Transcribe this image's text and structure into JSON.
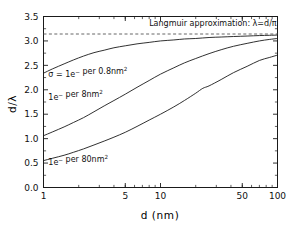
{
  "chart_data": {
    "type": "line",
    "title": "",
    "xlabel": "d  (nm)",
    "ylabel": "d/λ",
    "xscale": "log",
    "yscale": "linear",
    "xlim": [
      1,
      100
    ],
    "ylim": [
      0.0,
      3.5
    ],
    "grid": false,
    "legend_position": "inline-annotations",
    "xticks": [
      1,
      5,
      10,
      50,
      100
    ],
    "xticklabels": [
      "1",
      "5",
      "10",
      "50",
      "100"
    ],
    "yticks": [
      0.0,
      0.5,
      1.0,
      1.5,
      2.0,
      2.5,
      3.0,
      3.5
    ],
    "yticklabels": [
      "0.0",
      "0.5",
      "1.0",
      "1.5",
      "2.0",
      "2.5",
      "3.0",
      "3.5"
    ],
    "annotations": [
      {
        "name": "langmuir-approximation-label",
        "text": "Langmuir approximation: λ=d/π",
        "x": 8.0,
        "y": 3.3
      },
      {
        "name": "sigma-0p8nm2-label",
        "text": "σ = 1e⁻ per 0.8nm²",
        "x": 1.1,
        "y": 2.26
      },
      {
        "name": "sigma-8nm2-label",
        "text": "1e⁻ per 8nm²",
        "x": 1.1,
        "y": 1.8
      },
      {
        "name": "sigma-80nm2-label",
        "text": "1e⁻ per 80nm²",
        "x": 1.1,
        "y": 0.47
      }
    ],
    "asymptote": {
      "name": "langmuir-limit",
      "label": "λ=d/π",
      "value": 3.1416,
      "style": "dashed",
      "color": "#555555"
    },
    "series": [
      {
        "name": "1e- per 0.8nm2",
        "label": "σ = 1e⁻ per 0.8nm²",
        "color": "#1a1a1a",
        "x": [
          1.0,
          1.2,
          1.5,
          1.8,
          2.2,
          2.7,
          3.3,
          4.0,
          5.0,
          6.3,
          8.0,
          10.0,
          13.0,
          16.0,
          20.0,
          26.0,
          33.0,
          42.0,
          55.0,
          70.0,
          85.0,
          100.0
        ],
        "y": [
          2.34,
          2.43,
          2.53,
          2.61,
          2.69,
          2.76,
          2.81,
          2.86,
          2.9,
          2.94,
          2.97,
          3.0,
          3.02,
          3.04,
          3.05,
          3.07,
          3.08,
          3.09,
          3.1,
          3.11,
          3.115,
          3.12
        ]
      },
      {
        "name": "1e- per 8nm2",
        "label": "1e⁻ per 8nm²",
        "color": "#1a1a1a",
        "x": [
          1.0,
          1.2,
          1.5,
          1.8,
          2.2,
          2.7,
          3.3,
          4.0,
          5.0,
          6.3,
          8.0,
          10.0,
          13.0,
          16.0,
          20.0,
          26.0,
          33.0,
          42.0,
          55.0,
          70.0,
          85.0,
          100.0
        ],
        "y": [
          1.06,
          1.14,
          1.24,
          1.33,
          1.43,
          1.55,
          1.67,
          1.78,
          1.91,
          2.05,
          2.19,
          2.32,
          2.45,
          2.55,
          2.64,
          2.74,
          2.82,
          2.89,
          2.95,
          3.0,
          3.03,
          3.05
        ]
      },
      {
        "name": "1e- per 80nm2",
        "label": "1e⁻ per 80nm²",
        "color": "#1a1a1a",
        "x": [
          1.0,
          1.2,
          1.5,
          1.8,
          2.2,
          2.7,
          3.3,
          4.0,
          5.0,
          6.3,
          8.0,
          10.0,
          13.0,
          16.0,
          20.0,
          23.0,
          26.0,
          33.0,
          42.0,
          55.0,
          70.0,
          85.0,
          100.0
        ],
        "y": [
          0.55,
          0.6,
          0.66,
          0.72,
          0.79,
          0.87,
          0.95,
          1.03,
          1.13,
          1.25,
          1.38,
          1.5,
          1.65,
          1.78,
          1.93,
          2.03,
          2.08,
          2.21,
          2.35,
          2.48,
          2.6,
          2.66,
          2.71
        ]
      }
    ]
  },
  "axes": {
    "xlabel": "d  (nm)",
    "ylabel": "d/λ"
  }
}
